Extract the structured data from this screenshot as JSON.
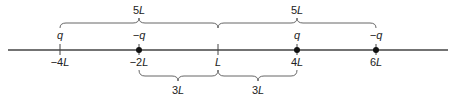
{
  "axis": {
    "y": 50,
    "x_start": 8,
    "x_end": 448,
    "color": "#444444"
  },
  "points": [
    {
      "x": 60,
      "position": "−4",
      "charge": "q",
      "dot": false
    },
    {
      "x": 139,
      "position": "−2",
      "charge": "−q",
      "dot": true
    },
    {
      "x": 218,
      "position": "",
      "charge": "",
      "dot": false
    },
    {
      "x": 297,
      "position": "4",
      "charge": "q",
      "dot": true
    },
    {
      "x": 376,
      "position": "6",
      "charge": "−q",
      "dot": true
    }
  ],
  "labels": {
    "p0_pos": "−4",
    "p1_pos": "−2",
    "p3_pos": "4",
    "p4_pos": "6",
    "unit": "L",
    "p0_charge": "q",
    "p1_charge": "−q",
    "p3_charge": "q",
    "p4_charge": "−q",
    "top_left_num": "5",
    "top_right_num": "5",
    "bottom_left_num": "3",
    "bottom_right_num": "3"
  },
  "braces": {
    "top": [
      {
        "from": 60,
        "to": 218,
        "label": "5L"
      },
      {
        "from": 218,
        "to": 376,
        "label": "5L"
      }
    ],
    "bottom": [
      {
        "from": 139,
        "to": 218,
        "label": "3L"
      },
      {
        "from": 218,
        "to": 297,
        "label": "3L"
      }
    ]
  }
}
